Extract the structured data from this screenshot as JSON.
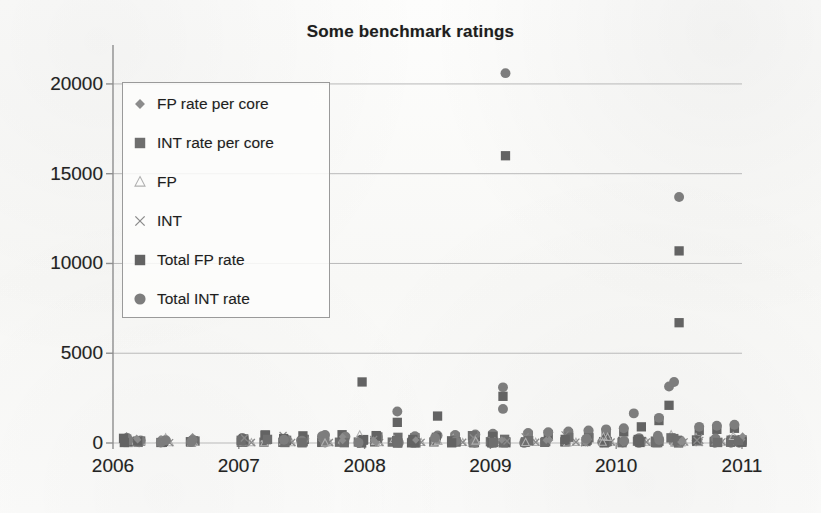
{
  "chart_data": {
    "type": "scatter",
    "title": "Some benchmark ratings",
    "xlabel": "",
    "ylabel": "",
    "xlim": [
      2006,
      2011
    ],
    "ylim": [
      0,
      21500
    ],
    "grid": true,
    "xticks": [
      "2006",
      "2007",
      "2008",
      "2009",
      "2010",
      "2011"
    ],
    "yticks": [
      "0",
      "5000",
      "10000",
      "15000",
      "20000"
    ],
    "ytick_values": [
      0,
      5000,
      10000,
      15000,
      20000
    ],
    "legend_position": "upper-left-inside",
    "series": [
      {
        "name": "FP rate per core",
        "marker": "diamond",
        "color": "#8c8c8c",
        "points": [
          [
            2006.12,
            18
          ],
          [
            2006.2,
            20
          ],
          [
            2006.38,
            15
          ],
          [
            2006.62,
            22
          ],
          [
            2007.02,
            26
          ],
          [
            2007.2,
            30
          ],
          [
            2007.35,
            24
          ],
          [
            2007.5,
            28
          ],
          [
            2007.66,
            32
          ],
          [
            2007.8,
            27
          ],
          [
            2007.95,
            35
          ],
          [
            2008.08,
            38
          ],
          [
            2008.22,
            30
          ],
          [
            2008.38,
            42
          ],
          [
            2008.55,
            36
          ],
          [
            2008.7,
            44
          ],
          [
            2008.86,
            40
          ],
          [
            2009.0,
            48
          ],
          [
            2009.12,
            52
          ],
          [
            2009.28,
            45
          ],
          [
            2009.44,
            55
          ],
          [
            2009.6,
            50
          ],
          [
            2009.76,
            58
          ],
          [
            2009.9,
            54
          ],
          [
            2010.05,
            62
          ],
          [
            2010.2,
            58
          ],
          [
            2010.34,
            66
          ],
          [
            2010.5,
            70
          ],
          [
            2010.64,
            60
          ],
          [
            2010.78,
            64
          ],
          [
            2010.92,
            68
          ],
          [
            2011.0,
            72
          ]
        ]
      },
      {
        "name": "INT rate per core",
        "marker": "square",
        "color": "#6e6e6e",
        "points": [
          [
            2006.12,
            30
          ],
          [
            2006.2,
            34
          ],
          [
            2006.38,
            28
          ],
          [
            2006.62,
            36
          ],
          [
            2007.02,
            42
          ],
          [
            2007.2,
            46
          ],
          [
            2007.35,
            40
          ],
          [
            2007.5,
            44
          ],
          [
            2007.66,
            50
          ],
          [
            2007.8,
            45
          ],
          [
            2007.95,
            54
          ],
          [
            2008.08,
            58
          ],
          [
            2008.22,
            50
          ],
          [
            2008.38,
            62
          ],
          [
            2008.55,
            56
          ],
          [
            2008.7,
            66
          ],
          [
            2008.86,
            60
          ],
          [
            2009.0,
            70
          ],
          [
            2009.12,
            76
          ],
          [
            2009.28,
            68
          ],
          [
            2009.44,
            80
          ],
          [
            2009.6,
            74
          ],
          [
            2009.76,
            84
          ],
          [
            2009.9,
            78
          ],
          [
            2010.05,
            90
          ],
          [
            2010.2,
            86
          ],
          [
            2010.34,
            96
          ],
          [
            2010.5,
            100
          ],
          [
            2010.64,
            88
          ],
          [
            2010.78,
            94
          ],
          [
            2010.92,
            98
          ],
          [
            2011.0,
            104
          ]
        ]
      },
      {
        "name": "FP",
        "marker": "triangle",
        "color": "#b0b0b0",
        "points": [
          [
            2006.16,
            12
          ],
          [
            2006.45,
            14
          ],
          [
            2007.1,
            18
          ],
          [
            2007.42,
            20
          ],
          [
            2007.72,
            22
          ],
          [
            2008.12,
            26
          ],
          [
            2008.45,
            28
          ],
          [
            2008.78,
            30
          ],
          [
            2009.06,
            34
          ],
          [
            2009.36,
            36
          ],
          [
            2009.68,
            38
          ],
          [
            2009.96,
            42
          ],
          [
            2010.24,
            46
          ],
          [
            2010.54,
            48
          ],
          [
            2010.84,
            52
          ]
        ]
      },
      {
        "name": "INT",
        "marker": "x",
        "color": "#8a8a8a",
        "points": [
          [
            2006.16,
            20
          ],
          [
            2006.45,
            22
          ],
          [
            2007.1,
            26
          ],
          [
            2007.42,
            28
          ],
          [
            2007.72,
            30
          ],
          [
            2008.12,
            34
          ],
          [
            2008.45,
            36
          ],
          [
            2008.78,
            40
          ],
          [
            2009.06,
            44
          ],
          [
            2009.36,
            46
          ],
          [
            2009.68,
            50
          ],
          [
            2009.96,
            54
          ],
          [
            2010.24,
            58
          ],
          [
            2010.54,
            62
          ],
          [
            2010.84,
            66
          ]
        ]
      },
      {
        "name": "Total FP rate",
        "marker": "square",
        "color": "#636363",
        "points": [
          [
            2006.12,
            90
          ],
          [
            2006.22,
            110
          ],
          [
            2006.4,
            95
          ],
          [
            2006.64,
            120
          ],
          [
            2007.04,
            160
          ],
          [
            2007.22,
            185
          ],
          [
            2007.38,
            150
          ],
          [
            2007.52,
            200
          ],
          [
            2007.68,
            230
          ],
          [
            2007.84,
            175
          ],
          [
            2007.98,
            3400
          ],
          [
            2008.1,
            250
          ],
          [
            2008.26,
            1150
          ],
          [
            2008.4,
            300
          ],
          [
            2008.58,
            1500
          ],
          [
            2008.72,
            330
          ],
          [
            2008.88,
            360
          ],
          [
            2009.02,
            400
          ],
          [
            2009.1,
            2600
          ],
          [
            2009.12,
            16000
          ],
          [
            2009.3,
            430
          ],
          [
            2009.46,
            470
          ],
          [
            2009.62,
            500
          ],
          [
            2009.78,
            540
          ],
          [
            2009.92,
            580
          ],
          [
            2010.06,
            620
          ],
          [
            2010.2,
            900
          ],
          [
            2010.34,
            1250
          ],
          [
            2010.42,
            2100
          ],
          [
            2010.5,
            6700
          ],
          [
            2010.5,
            10700
          ],
          [
            2010.66,
            700
          ],
          [
            2010.8,
            760
          ],
          [
            2010.94,
            820
          ],
          [
            2011.0,
            180
          ]
        ]
      },
      {
        "name": "Total INT rate",
        "marker": "circle",
        "color": "#7d7d7d",
        "points": [
          [
            2006.12,
            120
          ],
          [
            2006.22,
            140
          ],
          [
            2006.4,
            125
          ],
          [
            2006.64,
            150
          ],
          [
            2007.04,
            200
          ],
          [
            2007.22,
            230
          ],
          [
            2007.38,
            190
          ],
          [
            2007.52,
            250
          ],
          [
            2007.68,
            290
          ],
          [
            2007.84,
            220
          ],
          [
            2008.1,
            310
          ],
          [
            2008.26,
            1750
          ],
          [
            2008.4,
            380
          ],
          [
            2008.58,
            420
          ],
          [
            2008.72,
            450
          ],
          [
            2008.88,
            480
          ],
          [
            2009.02,
            520
          ],
          [
            2009.1,
            3100
          ],
          [
            2009.1,
            1900
          ],
          [
            2009.12,
            20600
          ],
          [
            2009.3,
            560
          ],
          [
            2009.46,
            600
          ],
          [
            2009.62,
            640
          ],
          [
            2009.78,
            700
          ],
          [
            2009.92,
            760
          ],
          [
            2010.06,
            820
          ],
          [
            2010.14,
            1650
          ],
          [
            2010.34,
            1400
          ],
          [
            2010.42,
            3150
          ],
          [
            2010.46,
            3400
          ],
          [
            2010.5,
            13700
          ],
          [
            2010.66,
            900
          ],
          [
            2010.8,
            960
          ],
          [
            2010.94,
            1020
          ],
          [
            2011.0,
            60
          ]
        ]
      }
    ],
    "annotations": [
      {
        "label": "max-outlier",
        "series": "Total INT rate",
        "x": 2009.12,
        "y": 20600
      },
      {
        "label": "second-outlier",
        "series": "Total FP rate",
        "x": 2009.12,
        "y": 16000
      },
      {
        "label": "late-outlier",
        "series": "Total INT rate",
        "x": 2010.5,
        "y": 13700
      },
      {
        "label": "late-outlier-fp",
        "series": "Total FP rate",
        "x": 2010.5,
        "y": 10700
      }
    ]
  },
  "legend": {
    "items": [
      {
        "label": "FP rate per core",
        "marker": "diamond",
        "color": "#8c8c8c"
      },
      {
        "label": "INT rate per core",
        "marker": "square",
        "color": "#6e6e6e"
      },
      {
        "label": "FP",
        "marker": "triangle",
        "color": "#b0b0b0"
      },
      {
        "label": "INT",
        "marker": "x",
        "color": "#8a8a8a"
      },
      {
        "label": "Total FP rate",
        "marker": "square",
        "color": "#636363"
      },
      {
        "label": "Total INT rate",
        "marker": "circle",
        "color": "#7d7d7d"
      }
    ]
  },
  "style": {
    "axis_color": "#8e8e8e",
    "grid_color": "#b9b9b9",
    "text_color": "#232323",
    "background": "#fbfbfa"
  }
}
